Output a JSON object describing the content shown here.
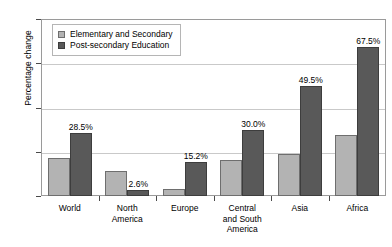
{
  "chart_data": {
    "type": "bar",
    "title": "",
    "xlabel": "",
    "ylabel": "Percentage change",
    "ylim": [
      0,
      80
    ],
    "yticks": [
      0,
      20,
      40,
      60,
      80
    ],
    "grid": true,
    "legend_position": "top-left",
    "categories": [
      "World",
      "North America",
      "Europe",
      "Central and South America",
      "Asia",
      "Africa"
    ],
    "category_lines": [
      [
        "World"
      ],
      [
        "North",
        "America"
      ],
      [
        "Europe"
      ],
      [
        "Central",
        "and South",
        "America"
      ],
      [
        "Asia"
      ],
      [
        "Africa"
      ]
    ],
    "series": [
      {
        "name": "Elementary and Secondary",
        "color": "#b3b3b3",
        "values": [
          17.0,
          11.5,
          3.0,
          16.5,
          19.0,
          27.5
        ],
        "labels": [
          "",
          "",
          "",
          "",
          "",
          ""
        ]
      },
      {
        "name": "Post-secondary Education",
        "color": "#595959",
        "values": [
          28.5,
          2.6,
          15.2,
          30.0,
          49.5,
          67.5
        ],
        "labels": [
          "28.5%",
          "2.6%",
          "15.2%",
          "30.0%",
          "49.5%",
          "67.5%"
        ]
      }
    ]
  },
  "legend": {
    "items": [
      {
        "label": "Elementary and Secondary",
        "swatch": "light"
      },
      {
        "label": "Post-secondary Education",
        "swatch": "dark"
      }
    ]
  },
  "axis": {
    "y_title": "Percentage change",
    "y_tick_labels": [
      "80",
      "60",
      "40",
      "20",
      "0"
    ]
  }
}
